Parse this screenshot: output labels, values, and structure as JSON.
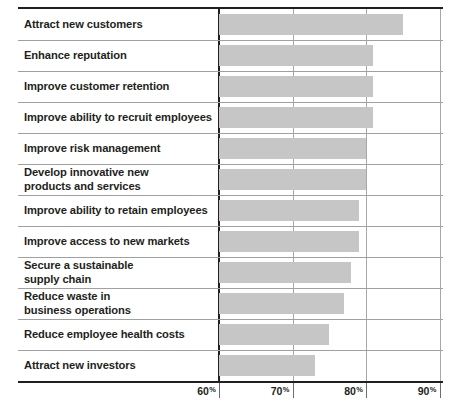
{
  "chart_data": {
    "type": "bar",
    "orientation": "horizontal",
    "title": "",
    "subtitle": "",
    "xlabel": "",
    "ylabel": "",
    "xlim": [
      60,
      92
    ],
    "grid": true,
    "legend": null,
    "value_unit": "%",
    "axis_ticks": [
      {
        "value": 60,
        "label": "60",
        "suffix": "%"
      },
      {
        "value": 70,
        "label": "70",
        "suffix": "%"
      },
      {
        "value": 80,
        "label": "80",
        "suffix": "%"
      },
      {
        "value": 90,
        "label": "90",
        "suffix": "%"
      }
    ],
    "categories": [
      "Attract new customers",
      "Enhance reputation",
      "Improve customer retention",
      "Improve ability to recruit employees",
      "Improve risk management",
      "Develop innovative new products and services",
      "Improve ability to retain employees",
      "Improve access to new markets",
      "Secure a sustainable supply chain",
      "Reduce waste in business operations",
      "Reduce employee health costs",
      "Attract new investors"
    ],
    "values": [
      85,
      81,
      81,
      81,
      80,
      80,
      79,
      79,
      78,
      77,
      75,
      73
    ],
    "bar_color": "#c6c6c6"
  },
  "rows": [
    {
      "lines": [
        "Attract new customers"
      ],
      "value": 85
    },
    {
      "lines": [
        "Enhance reputation"
      ],
      "value": 81
    },
    {
      "lines": [
        "Improve customer retention"
      ],
      "value": 81
    },
    {
      "lines": [
        "Improve ability to recruit employees"
      ],
      "value": 81
    },
    {
      "lines": [
        "Improve risk management"
      ],
      "value": 80
    },
    {
      "lines": [
        "Develop innovative new",
        "products and services"
      ],
      "value": 80
    },
    {
      "lines": [
        "Improve ability to retain employees"
      ],
      "value": 79
    },
    {
      "lines": [
        "Improve access to new markets"
      ],
      "value": 79
    },
    {
      "lines": [
        "Secure a sustainable",
        "supply chain"
      ],
      "value": 78
    },
    {
      "lines": [
        "Reduce waste in",
        "business operations"
      ],
      "value": 77
    },
    {
      "lines": [
        "Reduce employee health costs"
      ],
      "value": 75
    },
    {
      "lines": [
        "Attract new investors"
      ],
      "value": 73
    }
  ],
  "colors": {
    "bar": "#c6c6c6",
    "rule": "#231f20",
    "gridline": "#a8a8a8",
    "text": "#231f20"
  }
}
